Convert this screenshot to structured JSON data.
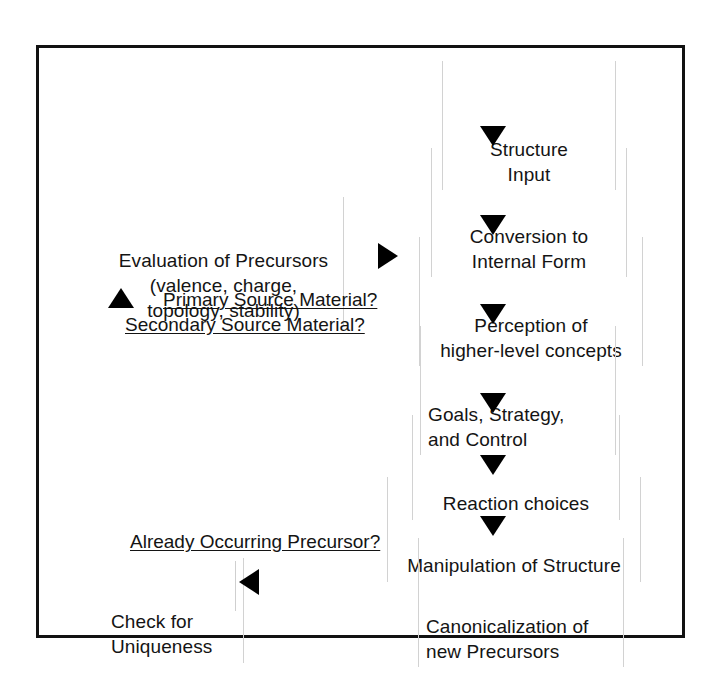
{
  "figure": {
    "type": "flowchart",
    "orientation": "vertical-main-column-with-left-annotations",
    "border_color": "#111111",
    "text_color": "#141414",
    "background": "#ffffff"
  },
  "main_flow": {
    "direction": "top-to-bottom",
    "arrow_glyph": "down-triangle",
    "steps": [
      {
        "id": "structure-input",
        "label": "Structure\nInput",
        "align": "center"
      },
      {
        "id": "conversion",
        "label": "Conversion to\nInternal Form",
        "align": "center"
      },
      {
        "id": "perception",
        "label": "Perception of\nhigher-level concepts",
        "align": "center"
      },
      {
        "id": "goals-strategy-control",
        "label": "Goals, Strategy,\nand Control",
        "align": "left"
      },
      {
        "id": "reaction-choices",
        "label": "Reaction choices",
        "align": "center"
      },
      {
        "id": "manipulation",
        "label": "Manipulation of Structure",
        "align": "center"
      },
      {
        "id": "canonicalization",
        "label": "Canonicalization of\nnew Precursors",
        "align": "left"
      }
    ]
  },
  "annotations": {
    "evaluation_block": {
      "id": "evaluation-of-precursors",
      "label": "Evaluation of Precursors\n(valence, charge,\ntopology, stability)"
    },
    "check_block": {
      "id": "check-for-uniqueness",
      "label": "Check for\nUniqueness"
    },
    "labels": [
      {
        "id": "primary-source-material",
        "text": "Primary Source Material?",
        "underlined": true
      },
      {
        "id": "secondary-source-material",
        "text": "Secondary Source Material?",
        "underlined": true
      },
      {
        "id": "already-occurring-precursor",
        "text": "Already Occurring Precursor?",
        "underlined": true
      }
    ]
  },
  "arrows": {
    "down": "down-arrow-icon",
    "up": "up-arrow-icon",
    "right": "right-arrow-icon",
    "left": "left-arrow-icon"
  }
}
